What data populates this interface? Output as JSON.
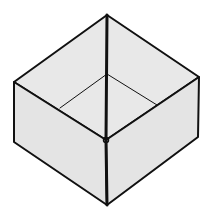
{
  "diagram": {
    "title": "",
    "colors": {
      "background": "#ffffff",
      "fill": "#e4e4e4",
      "inner_fill": "#e8e8e8",
      "stroke": "#111111"
    },
    "vertices": {
      "top": [
        107,
        15
      ],
      "left_top": [
        14,
        82
      ],
      "right_top": [
        199,
        77
      ],
      "front_top": [
        106,
        140
      ],
      "left_bottom": [
        14,
        142
      ],
      "right_bottom": [
        198,
        137
      ],
      "bottom": [
        107,
        205
      ],
      "inner_floor": [
        107,
        74
      ],
      "inner_left_end": [
        60,
        108
      ],
      "inner_right_end": [
        157,
        105
      ]
    }
  }
}
